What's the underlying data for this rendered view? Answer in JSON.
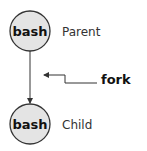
{
  "diagram": {
    "parent": {
      "process": "bash",
      "role": "Parent"
    },
    "child": {
      "process": "bash",
      "role": "Child"
    },
    "operation": {
      "label": "fork"
    },
    "colors": {
      "node_fill": "#e4e4e4",
      "stroke": "#333333"
    }
  }
}
